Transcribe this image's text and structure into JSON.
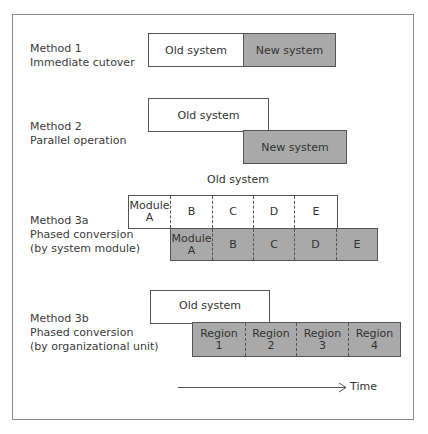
{
  "time_label": "Time",
  "methods": [
    {
      "line1": "Method 1",
      "line2": "Immediate cutover",
      "line3": "",
      "old": "Old system",
      "new": "New system"
    },
    {
      "line1": "Method 2",
      "line2": "Parallel operation",
      "line3": "",
      "old": "Old system",
      "new": "New system"
    },
    {
      "line1": "Method 3a",
      "line2": "Phased conversion",
      "line3": "(by system module)",
      "old_caption": "Old system",
      "old_cells": [
        "Module\nA",
        "B",
        "C",
        "D",
        "E"
      ],
      "new_cells": [
        "Module\nA",
        "B",
        "C",
        "D",
        "E"
      ]
    },
    {
      "line1": "Method 3b",
      "line2": "Phased conversion",
      "line3": "(by organizational unit)",
      "old": "Old system",
      "new_cells": [
        "Region\n1",
        "Region\n2",
        "Region\n3",
        "Region\n4"
      ]
    }
  ]
}
